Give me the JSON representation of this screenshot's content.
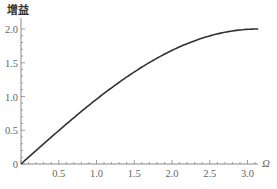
{
  "chart_data": {
    "type": "line",
    "title": "",
    "xlabel": "Ω",
    "ylabel": "增益",
    "xlim": [
      0,
      3.1416
    ],
    "ylim": [
      0,
      2.0
    ],
    "grid": false,
    "legend": null,
    "x_ticks": [
      "0",
      "0.5",
      "1.0",
      "1.5",
      "2.0",
      "2.5",
      "3.0"
    ],
    "y_ticks": [
      "0",
      "0.5",
      "1.0",
      "1.5",
      "2.0"
    ],
    "series": [
      {
        "name": "gain",
        "formula": "2*sin(Ω/2)",
        "x": [
          0,
          0.25,
          0.5,
          0.75,
          1.0,
          1.25,
          1.5,
          1.75,
          2.0,
          2.25,
          2.5,
          2.75,
          3.0,
          3.1416
        ],
        "values": [
          0,
          0.249,
          0.495,
          0.732,
          0.959,
          1.173,
          1.364,
          1.539,
          1.683,
          1.802,
          1.898,
          1.962,
          1.995,
          2.0
        ]
      }
    ],
    "line_color": "#333333",
    "axis_color": "#888888"
  }
}
